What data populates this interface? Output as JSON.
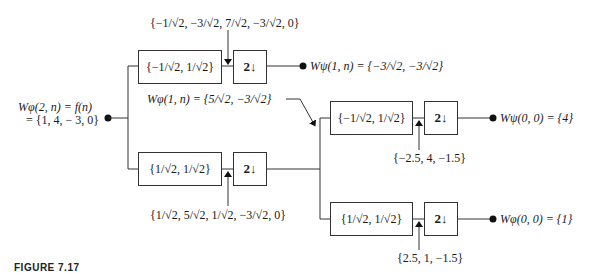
{
  "diagram": {
    "type": "two-scale FWT analysis filter bank",
    "input": {
      "line1": "Wφ(2, n) = f(n)",
      "line2": "= {1, 4,  − 3, 0}"
    },
    "stage1": {
      "highpass_filter": "{−1/√2, 1/√2}",
      "lowpass_filter": "{1/√2, 1/√2}",
      "downsampler_label": "2",
      "highpass_conv_result": "{−1/√2, −3/√2, 7/√2, −3/√2, 0}",
      "lowpass_conv_result": "{1/√2, 5/√2, 1/√2, −3/√2, 0}",
      "detail_output": "Wψ(1, n) = {−3/√2, −3/√2}",
      "approx_output": "Wφ(1, n) = {5/√2, −3/√2}"
    },
    "stage2": {
      "highpass_filter": "{−1/√2, 1/√2}",
      "lowpass_filter": "{1/√2, 1/√2}",
      "downsampler_label": "2",
      "highpass_conv_result": "{−2.5, 4, −1.5}",
      "lowpass_conv_result": "{2.5, 1, −1.5}",
      "detail_output": "Wψ(0, 0) = {4}",
      "approx_output": "Wφ(0, 0) = {1}"
    }
  },
  "caption": {
    "figure_label": "FIGURE 7.17",
    "text": "(caption text cut off)"
  }
}
